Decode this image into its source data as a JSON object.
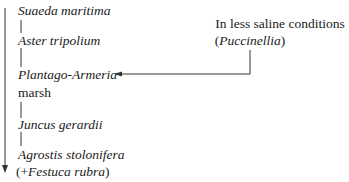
{
  "diagram": {
    "succession": [
      {
        "label": "Suaeda maritima",
        "style": "italic"
      },
      {
        "label": "Aster tripolium",
        "style": "italic"
      },
      {
        "label": "Plantago-Armeria",
        "style": "italic",
        "suffix": "marsh"
      },
      {
        "label": "Juncus gerardii",
        "style": "italic"
      },
      {
        "label": "Agrostis stolonifera",
        "style": "italic",
        "note_prefix": "(+",
        "note": "Festuca rubra",
        "note_suffix": ")"
      }
    ],
    "side_branch": {
      "line1": "In less saline conditions",
      "line2_prefix": "(",
      "line2": "Puccinellia",
      "line2_suffix": ")",
      "points_to": "Plantago-Armeria"
    },
    "colors": {
      "ink": "#1a1a1a",
      "background": "#ffffff"
    }
  }
}
